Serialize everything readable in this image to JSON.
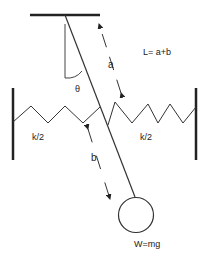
{
  "diagram": {
    "labels": {
      "length_eq": "L= a+b",
      "a": "a",
      "b": "b",
      "theta": "θ",
      "spring_left": "k/2",
      "spring_right": "k/2",
      "weight": "W=mg"
    },
    "colors": {
      "stroke": "#222222",
      "background": "#ffffff"
    }
  }
}
